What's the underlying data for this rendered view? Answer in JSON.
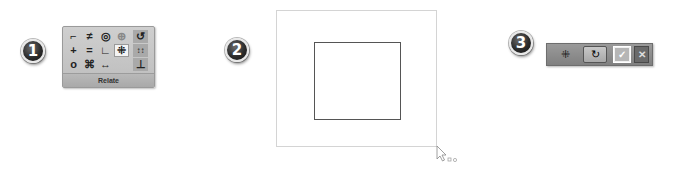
{
  "steps": [
    {
      "number": "1"
    },
    {
      "number": "2"
    },
    {
      "number": "3"
    }
  ],
  "ribbon": {
    "group_label": "Relate",
    "icons": [
      {
        "name": "perpendicular-icon",
        "glyph": "⌐"
      },
      {
        "name": "parallel-icon",
        "glyph": "≠"
      },
      {
        "name": "concentric-icon",
        "glyph": "◎"
      },
      {
        "name": "lock-icon",
        "glyph": "⊕"
      },
      {
        "name": "relate-assist-icon",
        "glyph": "↺"
      },
      {
        "name": "collinear-icon",
        "glyph": "+"
      },
      {
        "name": "equal-icon",
        "glyph": "="
      },
      {
        "name": "horizontal-vertical-icon",
        "glyph": "∟"
      },
      {
        "name": "symmetric-icon",
        "glyph": "⁜"
      },
      {
        "name": "dimension-icon",
        "glyph": "↕↕"
      },
      {
        "name": "tangent-icon",
        "glyph": "o"
      },
      {
        "name": "rigid-set-icon",
        "glyph": "⌘"
      },
      {
        "name": "connect-icon",
        "glyph": "↔"
      },
      {
        "name": "maintain-relationships-icon",
        "glyph": "⊥"
      }
    ]
  },
  "canvas": {
    "outer_rect_color": "#d4d4d4",
    "inner_rect_color": "#555555"
  },
  "toolbar": {
    "select_glyph": "⁜",
    "rotate_glyph": "↻",
    "accept_glyph": "✓",
    "cancel_glyph": "✕"
  }
}
